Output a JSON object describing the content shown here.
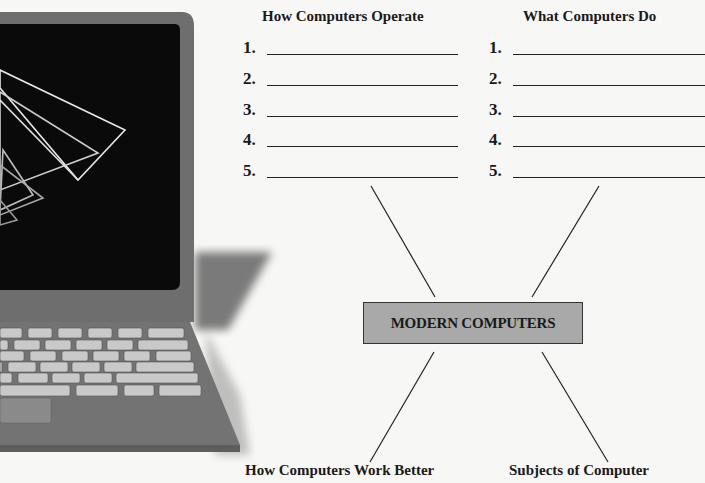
{
  "diagram": {
    "center": {
      "label": "MODERN COMPUTERS",
      "fill": "#a9a9a9"
    },
    "branches": [
      {
        "heading": "How Computers Operate",
        "position": "top-left",
        "items": [
          "1.",
          "2.",
          "3.",
          "4.",
          "5."
        ]
      },
      {
        "heading": "What Computers Do",
        "position": "top-right",
        "items": [
          "1.",
          "2.",
          "3.",
          "4.",
          "5."
        ]
      },
      {
        "heading": "How Computers Work Better",
        "position": "bottom-left"
      },
      {
        "heading": "Subjects of Computer",
        "position": "bottom-right"
      }
    ]
  },
  "illustration": {
    "name": "laptop",
    "screen_graphic": "wireframe-pyramids"
  }
}
